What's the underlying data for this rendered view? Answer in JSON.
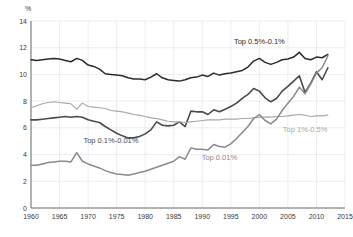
{
  "chart_data": {
    "type": "line",
    "title": "",
    "subtitle": "",
    "xlabel": "",
    "ylabel": "%",
    "unit_label": "%",
    "xlim": [
      1960,
      2015
    ],
    "ylim": [
      0,
      14
    ],
    "grid": true,
    "legend_position": "inline-annotations",
    "x_ticks": [
      "1960",
      "1965",
      "1970",
      "1975",
      "1980",
      "1985",
      "1990",
      "1995",
      "2000",
      "2005",
      "2010",
      "2015"
    ],
    "y_ticks": [
      "0",
      "2",
      "4",
      "6",
      "8",
      "10",
      "12",
      "14"
    ],
    "x": [
      1960,
      1961,
      1962,
      1963,
      1964,
      1965,
      1966,
      1967,
      1968,
      1969,
      1970,
      1971,
      1972,
      1973,
      1974,
      1975,
      1976,
      1977,
      1978,
      1979,
      1980,
      1981,
      1982,
      1983,
      1984,
      1985,
      1986,
      1987,
      1988,
      1989,
      1990,
      1991,
      1992,
      1993,
      1994,
      1995,
      1996,
      1997,
      1998,
      1999,
      2000,
      2001,
      2002,
      2003,
      2004,
      2005,
      2006,
      2007,
      2008,
      2009,
      2010,
      2011,
      2012
    ],
    "series": [
      {
        "name": "Top 0.5%-0.1%",
        "color": "#2b2b2b",
        "width": 1.5,
        "label": "Top 0.5%-0.1%",
        "label_x": 2000,
        "label_y": 12.25,
        "values": [
          11.1,
          11.05,
          11.1,
          11.15,
          11.2,
          11.15,
          11.05,
          10.95,
          11.2,
          11.05,
          10.7,
          10.6,
          10.4,
          10.05,
          10.0,
          9.95,
          9.9,
          9.75,
          9.65,
          9.65,
          9.6,
          9.8,
          10.05,
          9.75,
          9.6,
          9.55,
          9.5,
          9.6,
          9.75,
          9.8,
          9.95,
          9.85,
          10.1,
          9.95,
          10.05,
          10.1,
          10.2,
          10.3,
          10.55,
          11.0,
          11.2,
          10.9,
          10.75,
          10.9,
          11.1,
          11.15,
          11.3,
          11.65,
          11.2,
          11.1,
          11.3,
          11.25,
          11.5
        ]
      },
      {
        "name": "Top 0.1%-0.01%",
        "color": "#4a4a4a",
        "width": 1.6,
        "label": "Top 0.1%-0.01%",
        "label_x": 1974,
        "label_y": 4.85,
        "values": [
          6.6,
          6.6,
          6.65,
          6.7,
          6.75,
          6.8,
          6.85,
          6.8,
          6.85,
          6.8,
          6.6,
          6.5,
          6.4,
          6.1,
          5.85,
          5.6,
          5.4,
          5.25,
          5.25,
          5.35,
          5.55,
          5.85,
          6.45,
          6.2,
          6.15,
          6.2,
          6.45,
          6.1,
          7.25,
          7.2,
          7.2,
          7.0,
          7.35,
          7.2,
          7.4,
          7.6,
          7.85,
          8.2,
          8.5,
          8.95,
          8.75,
          8.25,
          7.95,
          8.2,
          8.75,
          9.1,
          9.5,
          9.9,
          8.65,
          9.35,
          10.2,
          9.6,
          10.5
        ]
      },
      {
        "name": "Top 1%-0.5%",
        "color": "#a8a8a8",
        "width": 1.1,
        "label": "Top 1%-0.5%",
        "label_x": 2008,
        "label_y": 5.7,
        "values": [
          7.5,
          7.65,
          7.8,
          7.9,
          7.95,
          7.9,
          7.85,
          7.8,
          7.4,
          7.85,
          7.6,
          7.55,
          7.5,
          7.45,
          7.3,
          7.25,
          7.2,
          7.1,
          7.0,
          6.95,
          6.85,
          6.75,
          6.7,
          6.6,
          6.5,
          6.45,
          6.45,
          6.4,
          6.45,
          6.5,
          6.55,
          6.6,
          6.6,
          6.6,
          6.65,
          6.65,
          6.65,
          6.7,
          6.7,
          6.75,
          6.8,
          6.8,
          6.8,
          6.85,
          6.85,
          6.9,
          6.95,
          7.0,
          6.95,
          6.85,
          6.9,
          6.9,
          6.95
        ]
      },
      {
        "name": "Top 0.01%",
        "color": "#8a8a8a",
        "width": 1.5,
        "label": "Top 0.01%",
        "label_x": 1993,
        "label_y": 3.6,
        "values": [
          3.2,
          3.2,
          3.3,
          3.4,
          3.45,
          3.5,
          3.5,
          3.45,
          4.15,
          3.5,
          3.3,
          3.15,
          3.0,
          2.8,
          2.65,
          2.55,
          2.5,
          2.45,
          2.55,
          2.65,
          2.75,
          2.9,
          3.05,
          3.2,
          3.35,
          3.5,
          3.85,
          3.65,
          4.5,
          4.4,
          4.4,
          4.35,
          4.75,
          4.6,
          4.55,
          4.8,
          5.2,
          5.65,
          6.1,
          6.7,
          7.0,
          6.55,
          6.3,
          6.65,
          7.3,
          7.85,
          8.35,
          9.05,
          8.55,
          9.3,
          10.1,
          10.5,
          11.4
        ]
      }
    ]
  },
  "annotations": {
    "top_05_01": "Top 0.5%-0.1%",
    "top_01_001": "Top 0.1%-0.01%",
    "top_1_05": "Top 1%-0.5%",
    "top_001": "Top 0.01%"
  }
}
